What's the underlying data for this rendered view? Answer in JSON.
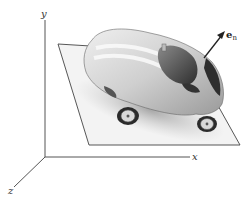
{
  "diagram": {
    "axes": {
      "y_label": "y",
      "x_label": "x",
      "z_label": "z"
    },
    "normal_vector": {
      "label_main": "e",
      "label_sub": "n"
    },
    "object": "sports car resting on a tilted plane",
    "colors": {
      "axis": "#555555",
      "plane_fill": "#f2f2f2",
      "plane_stroke": "#444444",
      "car_body": "#d4d4d4",
      "car_dark": "#3a3a3a",
      "arrow": "#222222"
    }
  }
}
